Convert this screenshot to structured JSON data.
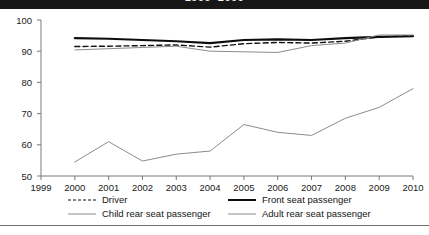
{
  "title": {
    "text": "1999–2009"
  },
  "legend": {
    "position": "below-plot",
    "items": [
      {
        "label": "Driver",
        "style": "dashed",
        "color": "#111111",
        "swatch": "dashed-line-swatch"
      },
      {
        "label": "Front seat passenger",
        "style": "thick-solid",
        "color": "#0d0d0d",
        "swatch": "thick-line-swatch"
      },
      {
        "label": "Child rear seat passenger",
        "style": "thin-solid",
        "color": "#8c8c8c",
        "swatch": "thin-line-swatch"
      },
      {
        "label": "Adult rear seat passenger",
        "style": "thin-solid",
        "color": "#8c8c8c",
        "swatch": "thin-line-swatch"
      }
    ]
  },
  "chart_data": {
    "type": "line",
    "title": "1999–2009",
    "xlabel": "",
    "ylabel": "",
    "xlim": [
      1999,
      2010
    ],
    "ylim": [
      50,
      100
    ],
    "yticks": [
      50,
      60,
      70,
      80,
      90,
      100
    ],
    "xticks": [
      1999,
      2000,
      2001,
      2002,
      2003,
      2004,
      2005,
      2006,
      2007,
      2008,
      2009,
      2010
    ],
    "grid": false,
    "x": [
      2000,
      2001,
      2002,
      2003,
      2004,
      2005,
      2006,
      2007,
      2008,
      2009,
      2010
    ],
    "series": [
      {
        "name": "Driver",
        "style": "dashed",
        "color": "#111111",
        "values": [
          91.5,
          91.6,
          91.8,
          92.0,
          91.3,
          92.4,
          92.8,
          92.6,
          93.2,
          94.6,
          95.0
        ]
      },
      {
        "name": "Front seat passenger",
        "style": "thick-solid",
        "color": "#0d0d0d",
        "values": [
          94.2,
          94.0,
          93.6,
          93.2,
          92.6,
          93.6,
          93.8,
          93.6,
          94.2,
          94.6,
          94.8
        ]
      },
      {
        "name": "Child rear seat passenger",
        "style": "thin-solid",
        "color": "#8c8c8c",
        "values": [
          90.4,
          90.8,
          91.2,
          91.6,
          90.0,
          89.8,
          89.6,
          91.8,
          92.6,
          95.2,
          95.2
        ]
      },
      {
        "name": "Adult rear seat passenger",
        "style": "thin-solid",
        "color": "#8c8c8c",
        "values": [
          54.5,
          61.0,
          54.8,
          57.0,
          58.0,
          66.5,
          64.0,
          63.0,
          68.5,
          72.0,
          78.0
        ]
      }
    ]
  }
}
